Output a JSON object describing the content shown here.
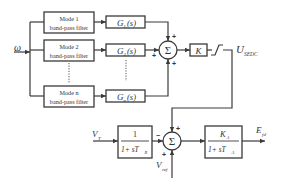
{
  "input_signal": "ω",
  "filters": [
    {
      "line1": "Mode 1",
      "line2": "band-pass filter",
      "gain": "G",
      "gain_sub": "1",
      "gain_arg": "(s)"
    },
    {
      "line1": "Mode 2",
      "line2": "band-pass filter",
      "gain": "G",
      "gain_sub": "2",
      "gain_arg": "(s)"
    },
    {
      "line1": "Mode n",
      "line2": "band-pass filter",
      "gain": "G",
      "gain_sub": "n",
      "gain_arg": "(s)"
    }
  ],
  "summer1": {
    "symbol": "Σ",
    "signs": [
      "+",
      "+",
      "+"
    ]
  },
  "gain_block": "K",
  "output_label": {
    "main": "U",
    "sub": "SEDC"
  },
  "vt_label": {
    "main": "V",
    "sub": "T"
  },
  "transducer": {
    "num": "1",
    "den_prefix": "1+ sT",
    "den_sub": "R"
  },
  "summer2": {
    "symbol": "Σ",
    "signs": [
      "−",
      "+",
      "+"
    ]
  },
  "vref_label": {
    "main": "V",
    "sub": "ref"
  },
  "exciter": {
    "num_main": "K",
    "num_sub": "A",
    "den_prefix": "1+ sT",
    "den_sub": "A"
  },
  "efd_label": {
    "main": "E",
    "sub": "fd"
  }
}
